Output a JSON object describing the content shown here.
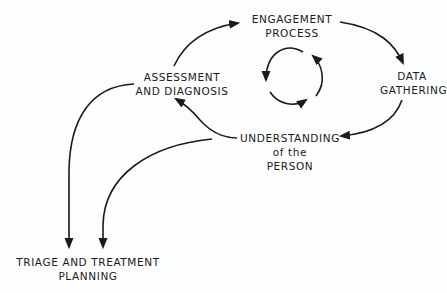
{
  "diagram": {
    "type": "cycle-flow",
    "nodes": {
      "engagement": {
        "line1": "ENGAGEMENT",
        "line2": "PROCESS"
      },
      "data": {
        "line1": "DATA",
        "line2": "GATHERING"
      },
      "understanding": {
        "line1": "UNDERSTANDING",
        "line2": "of the",
        "line3": "PERSON"
      },
      "assessment": {
        "line1": "ASSESSMENT",
        "line2": "AND DIAGNOSIS"
      },
      "triage": {
        "line1": "TRIAGE AND TREATMENT",
        "line2": "PLANNING"
      }
    },
    "edges": [
      {
        "from": "assessment",
        "to": "engagement"
      },
      {
        "from": "engagement",
        "to": "data"
      },
      {
        "from": "data",
        "to": "understanding"
      },
      {
        "from": "understanding",
        "to": "assessment"
      },
      {
        "from": "assessment",
        "to": "triage"
      },
      {
        "from": "understanding",
        "to": "triage"
      }
    ],
    "center_symbol": "circular-cycle-arrows",
    "stroke_color": "#1a1a1a"
  }
}
